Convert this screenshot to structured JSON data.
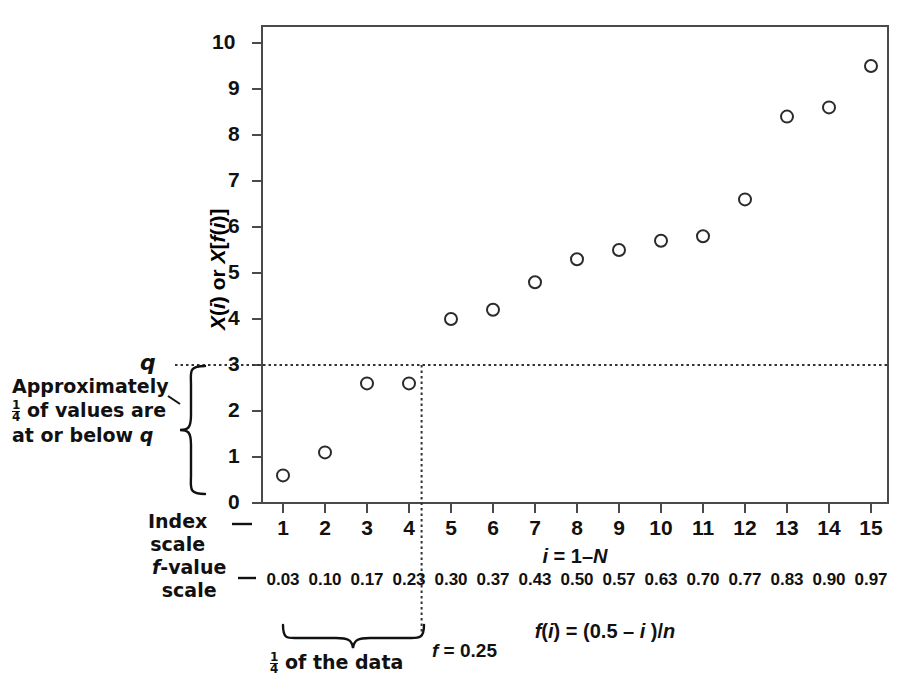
{
  "chart_data": {
    "type": "scatter",
    "title": "",
    "xlabel": "i = 1–N",
    "ylabel": "X(i) or X[f(i)]",
    "xlabel2": "f(i) = (0.5 – i )/n",
    "xlim": [
      0.4,
      15.6
    ],
    "ylim": [
      0,
      10.4
    ],
    "ytick_values": [
      0,
      1,
      2,
      3,
      4,
      5,
      6,
      7,
      8,
      9,
      10
    ],
    "yticks": [
      "0",
      "1",
      "2",
      "3",
      "4",
      "5",
      "6",
      "7",
      "8",
      "9",
      "10"
    ],
    "grid": false,
    "legend": "none",
    "x": [
      1,
      2,
      3,
      4,
      5,
      6,
      7,
      8,
      9,
      10,
      11,
      12,
      13,
      14,
      15
    ],
    "values": [
      0.6,
      1.1,
      2.6,
      2.6,
      4.0,
      4.2,
      4.8,
      5.3,
      5.5,
      5.7,
      5.8,
      6.6,
      8.4,
      8.6,
      9.5
    ],
    "index_scale_ticks": [
      "1",
      "2",
      "3",
      "4",
      "5",
      "6",
      "7",
      "8",
      "9",
      "10",
      "11",
      "12",
      "13",
      "14",
      "15"
    ],
    "f_scale_ticks": [
      "0.03",
      "0.10",
      "0.17",
      "0.23",
      "0.30",
      "0.37",
      "0.43",
      "0.50",
      "0.57",
      "0.63",
      "0.70",
      "0.77",
      "0.83",
      "0.90",
      "0.97"
    ],
    "marker": "open-circle",
    "marker_color": "#111111",
    "quantile_value": 3,
    "quantile_f": 0.25,
    "quantile_index_cut": 4.3
  },
  "axes": {
    "index_scale_label_line1": "Index",
    "index_scale_label_line2": "scale",
    "f_scale_label_line1": "f-value",
    "f_scale_label_line2": "scale",
    "index_scale_dash": "—",
    "f_scale_dash": "—"
  },
  "annotations": {
    "q_label": "q",
    "left_note_line1": "Approximately",
    "left_note_line2_pre": "",
    "left_note_line2_frac_num": "1",
    "left_note_line2_frac_den": "4",
    "left_note_line2_post": " of values are",
    "left_note_line3": "at or below ",
    "left_note_line3_italic": "q",
    "bottom_note_frac_num": "1",
    "bottom_note_frac_den": "4",
    "bottom_note_text": " of the data",
    "f_cut_label_italic": "f",
    "f_cut_label_rest": " = 0.25"
  },
  "colors": {
    "axis": "#4a4a4a",
    "text": "#111111",
    "marker": "#2b2b2b",
    "dotted": "#333333"
  }
}
